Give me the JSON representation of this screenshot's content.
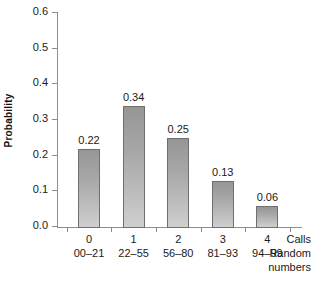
{
  "chart_data": {
    "type": "bar",
    "title": "",
    "subtitle": "",
    "xlabel": "Calls",
    "ylabel": "Probability",
    "categories": [
      "0",
      "1",
      "2",
      "3",
      "4"
    ],
    "values": [
      0.22,
      0.34,
      0.25,
      0.13,
      0.06
    ],
    "value_labels": [
      "0.22",
      "0.34",
      "0.25",
      "0.13",
      "0.06"
    ],
    "secondary_categories": [
      "00–21",
      "22–55",
      "56–80",
      "81–93",
      "94–99"
    ],
    "secondary_axis_label": "Random numbers",
    "axis_caption_lines": [
      "Calls",
      "Random",
      "numbers"
    ],
    "ylim": [
      0.0,
      0.6
    ],
    "ytick_values": [
      0.0,
      0.1,
      0.2,
      0.3,
      0.4,
      0.5,
      0.6
    ],
    "ytick_labels": [
      "0.0",
      "0.1",
      "0.2",
      "0.3",
      "0.4",
      "0.5",
      "0.6"
    ],
    "grid": false,
    "legend": false,
    "legend_position": "none",
    "bar_fill_top_color": "#969696",
    "bar_fill_bottom_color": "#cfcfcf",
    "bar_border_color": "#6f6f6f",
    "axis_color": "#8d8d8d",
    "background_color": "#ffffff",
    "text_color": "#1a1a1a"
  }
}
